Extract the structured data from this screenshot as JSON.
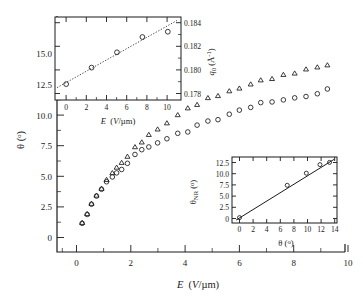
{
  "figure": {
    "caption": "",
    "background": "#ffffff",
    "ink_color": "#1a1a1a"
  },
  "chart_data": [
    {
      "id": "main",
      "type": "scatter",
      "title": "",
      "xlabel": "E (V/µm)",
      "ylabel": "θ (°)",
      "xlim": [
        -0.75,
        10.7
      ],
      "ylim": [
        -1.2,
        16.1
      ],
      "xticks": [
        0,
        2,
        4,
        6,
        8,
        10
      ],
      "xticklabels": [
        "0",
        "2",
        "4",
        "6",
        "8",
        "10"
      ],
      "yticks": [
        0,
        2.5,
        5.0,
        7.5,
        10.0,
        12.5,
        15.0
      ],
      "yticklabels": [
        "0",
        "2.5",
        "5.0",
        "7.5",
        "10.0",
        "12.5",
        "15.0"
      ],
      "grid": false,
      "legend": "none",
      "series": [
        {
          "name": "triangles",
          "marker": "triangle-up",
          "x": [
            0.25,
            0.45,
            0.62,
            0.82,
            1.02,
            1.22,
            1.45,
            1.62,
            1.82,
            2.05,
            2.35,
            2.62,
            2.9,
            3.25,
            3.62,
            4.05,
            4.45,
            4.82,
            5.25,
            5.65,
            6.1,
            6.5,
            6.95,
            7.35,
            7.8,
            8.25,
            8.7,
            9.15,
            9.6,
            10.0
          ],
          "y": [
            0.95,
            1.6,
            2.35,
            2.95,
            3.45,
            4.1,
            4.6,
            5.0,
            5.35,
            5.8,
            6.5,
            6.85,
            7.4,
            7.8,
            8.25,
            8.85,
            9.35,
            9.6,
            10.1,
            10.25,
            10.6,
            10.8,
            11.1,
            11.4,
            11.5,
            11.8,
            11.9,
            12.2,
            12.35,
            12.5
          ]
        },
        {
          "name": "circles",
          "marker": "circle",
          "x": [
            0.25,
            0.45,
            0.62,
            0.82,
            1.02,
            1.22,
            1.45,
            1.62,
            1.82,
            2.05,
            2.35,
            2.62,
            2.9,
            3.25,
            3.62,
            4.05,
            4.45,
            4.82,
            5.25,
            5.65,
            6.1,
            6.5,
            6.95,
            7.35,
            7.8,
            8.25,
            8.7,
            9.15,
            9.6,
            10.0
          ],
          "y": [
            0.9,
            1.55,
            2.3,
            2.9,
            3.4,
            3.95,
            4.3,
            4.6,
            4.85,
            5.3,
            5.95,
            6.3,
            6.5,
            6.8,
            7.1,
            7.5,
            7.6,
            8.1,
            8.4,
            8.5,
            8.9,
            9.2,
            9.4,
            9.75,
            9.8,
            9.95,
            10.1,
            10.2,
            10.4,
            10.75
          ]
        }
      ]
    },
    {
      "id": "inset-top-left",
      "type": "scatter",
      "title": "",
      "xlabel": "E (V/µm)",
      "ylabel": "q₀ (Å⁻¹)",
      "ylabel_side": "right",
      "xlim": [
        -1.1,
        11.3
      ],
      "ylim": [
        0.1774,
        0.18445
      ],
      "xticks": [
        0,
        2,
        4,
        6,
        8,
        10
      ],
      "xticklabels": [
        "0",
        "2",
        "4",
        "6",
        "8",
        "10"
      ],
      "yticks": [
        0.178,
        0.18,
        0.182,
        0.184
      ],
      "yticklabels": [
        "0.178",
        "0.180",
        "0.182",
        "0.184"
      ],
      "grid": false,
      "series": [
        {
          "name": "q0-vs-E",
          "marker": "circle",
          "x": [
            0.0,
            2.5,
            5.0,
            7.5,
            10.0
          ],
          "y": [
            0.17875,
            0.18015,
            0.18145,
            0.18275,
            0.1832
          ]
        },
        {
          "name": "linear-fit",
          "marker": "dotted-line",
          "x": [
            -0.9,
            10.9
          ],
          "y": [
            0.17845,
            0.18415
          ]
        }
      ]
    },
    {
      "id": "inset-bottom-right",
      "type": "scatter",
      "title": "",
      "xlabel": "θ (°)",
      "ylabel": "θNR (°)",
      "ylabel_sub": "NR",
      "xlim": [
        -1.1,
        14.3
      ],
      "ylim": [
        -1.1,
        13.6
      ],
      "xticks": [
        0,
        2,
        4,
        6,
        8,
        10,
        12,
        14
      ],
      "xticklabels": [
        "0",
        "2",
        "4",
        "6",
        "8",
        "10",
        "12",
        "14"
      ],
      "yticks": [
        0,
        2.5,
        5.0,
        7.5,
        10.0,
        12.5
      ],
      "yticklabels": [
        "0",
        "2.5",
        "5.0",
        "7.5",
        "10.0",
        "12.5"
      ],
      "grid": false,
      "series": [
        {
          "name": "theta-NR-vs-theta",
          "marker": "circle",
          "x": [
            0.0,
            7.0,
            9.8,
            11.8,
            13.2
          ],
          "y": [
            0.1,
            7.3,
            10.0,
            11.9,
            12.4
          ]
        },
        {
          "name": "linear-fit",
          "marker": "solid-line",
          "x": [
            -0.5,
            13.9
          ],
          "y": [
            -0.45,
            13.1
          ]
        }
      ]
    }
  ]
}
